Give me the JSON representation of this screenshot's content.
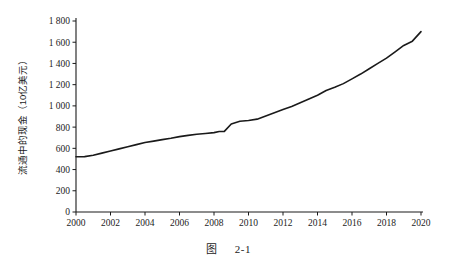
{
  "figure": {
    "caption_label": "图",
    "caption_number": "2-1"
  },
  "chart_data": {
    "type": "line",
    "title": "",
    "xlabel": "",
    "ylabel": "流通中的现金（10亿美元）",
    "xlim": [
      2000,
      2020
    ],
    "ylim": [
      0,
      1800
    ],
    "grid": false,
    "legend": "none",
    "xticks": [
      "2000",
      "2002",
      "2004",
      "2006",
      "2008",
      "2010",
      "2012",
      "2014",
      "2016",
      "2018",
      "2020"
    ],
    "xtick_values": [
      2000,
      2002,
      2004,
      2006,
      2008,
      2010,
      2012,
      2014,
      2016,
      2018,
      2020
    ],
    "yticks": [
      "0",
      "200",
      "400",
      "600",
      "800",
      "1 000",
      "1 200",
      "1 400",
      "1 600",
      "1 800"
    ],
    "ytick_values": [
      0,
      200,
      400,
      600,
      800,
      1000,
      1200,
      1400,
      1600,
      1800
    ],
    "line_color": "#1a1a1a",
    "line_width": 1.6,
    "x": [
      2000,
      2000.5,
      2001,
      2001.5,
      2002,
      2002.5,
      2003,
      2003.5,
      2004,
      2004.5,
      2005,
      2005.5,
      2006,
      2006.5,
      2007,
      2007.5,
      2008,
      2008.3,
      2008.6,
      2009,
      2009.5,
      2010,
      2010.5,
      2011,
      2011.5,
      2012,
      2012.5,
      2013,
      2013.5,
      2014,
      2014.5,
      2015,
      2015.5,
      2016,
      2016.5,
      2017,
      2017.5,
      2018,
      2018.5,
      2019,
      2019.5,
      2020
    ],
    "values": [
      520,
      522,
      535,
      555,
      575,
      595,
      615,
      635,
      655,
      668,
      682,
      695,
      710,
      722,
      733,
      740,
      748,
      758,
      760,
      830,
      855,
      862,
      875,
      905,
      935,
      965,
      995,
      1030,
      1065,
      1100,
      1145,
      1175,
      1210,
      1255,
      1300,
      1350,
      1400,
      1450,
      1510,
      1570,
      1610,
      1700
    ]
  }
}
